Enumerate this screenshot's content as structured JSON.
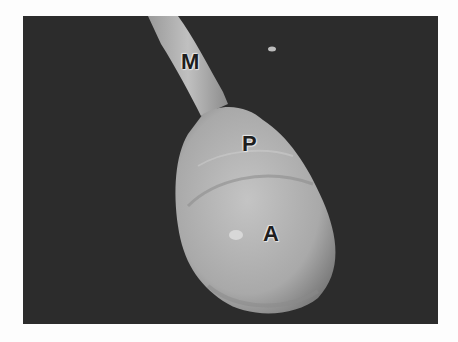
{
  "figure": {
    "type": "scanning electron micrograph",
    "labels": [
      {
        "id": "M",
        "text": "M",
        "x": 181,
        "y": 49
      },
      {
        "id": "P",
        "text": "P",
        "x": 242,
        "y": 131
      },
      {
        "id": "A",
        "text": "A",
        "x": 263,
        "y": 221
      }
    ],
    "colors": {
      "background": "#2c2c2c",
      "specimen": "#b9b9b9",
      "page": "#fdfdfd"
    }
  }
}
